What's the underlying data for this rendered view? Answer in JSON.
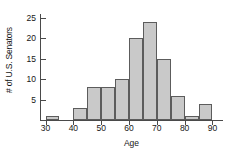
{
  "chart_data": {
    "type": "bar",
    "subtype": "histogram",
    "title": "",
    "xlabel": "Age",
    "ylabel": "# of U.S. Senators",
    "bin_width": 5,
    "bin_edges": [
      30,
      35,
      40,
      45,
      50,
      55,
      60,
      65,
      70,
      75,
      80,
      85,
      90
    ],
    "categories": [
      "30-35",
      "35-40",
      "40-45",
      "45-50",
      "50-55",
      "55-60",
      "60-65",
      "65-70",
      "70-75",
      "75-80",
      "80-85",
      "85-90"
    ],
    "values": [
      1,
      0,
      3,
      8,
      8,
      10,
      20,
      24,
      15,
      6,
      1,
      4
    ],
    "xlim": [
      28,
      92
    ],
    "ylim": [
      0,
      26
    ],
    "xticks": [
      30,
      40,
      50,
      60,
      70,
      80,
      90
    ],
    "xtick_labels": [
      "30",
      "40",
      "50",
      "60",
      "70",
      "80",
      "90"
    ],
    "yticks": [
      5,
      10,
      15,
      20,
      25
    ],
    "ytick_labels": [
      "5",
      "10",
      "15",
      "20",
      "25"
    ],
    "grid": false,
    "legend": null,
    "bar_color": "#c9c9c9",
    "bar_edge_color": "#5c5c5c",
    "axis_color": "#4a4a4a",
    "background_color": "#ffffff"
  }
}
